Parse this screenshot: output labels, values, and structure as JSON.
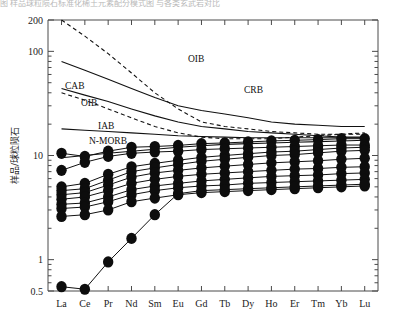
{
  "figure": {
    "top_caption_fragment": "图 样品球粒陨石标准化稀土元素配分模式图 与各类玄武岩对比",
    "y_axis_title": "样品/球粒陨石"
  },
  "chart_data": {
    "type": "line",
    "title": "",
    "subtitle": "",
    "xlabel": "",
    "ylabel": "样品/球粒陨石",
    "yscale": "log",
    "ylim": [
      0.5,
      200
    ],
    "grid": false,
    "legend_position": "inline-annotations",
    "categories": [
      "La",
      "Ce",
      "Pr",
      "Nd",
      "Sm",
      "Eu",
      "Gd",
      "Tb",
      "Dy",
      "Ho",
      "Er",
      "Tm",
      "Yb",
      "Lu"
    ],
    "y_tick_labels": [
      "200",
      "100",
      "10",
      "1",
      "0.5"
    ],
    "y_tick_values": [
      200,
      100,
      10,
      1,
      0.5
    ],
    "marker": "filled-circle",
    "series": [
      {
        "name": "sample-1",
        "style": "solid-marker",
        "values": [
          10.5,
          9.8,
          11.0,
          12.0,
          12.2,
          12.5,
          13.0,
          13.2,
          13.5,
          13.8,
          14.0,
          14.2,
          14.5,
          14.5
        ]
      },
      {
        "name": "sample-2",
        "style": "solid-marker",
        "values": [
          7.2,
          8.6,
          9.8,
          10.5,
          10.8,
          11.0,
          11.4,
          11.6,
          11.8,
          12.0,
          12.2,
          12.4,
          12.6,
          12.6
        ]
      },
      {
        "name": "sample-3",
        "style": "solid-marker",
        "values": [
          5.0,
          5.4,
          6.6,
          7.8,
          8.4,
          9.0,
          9.6,
          10.0,
          10.4,
          10.8,
          11.0,
          11.4,
          11.8,
          12.0
        ]
      },
      {
        "name": "sample-4",
        "style": "solid-marker",
        "values": [
          4.6,
          4.8,
          5.8,
          7.0,
          7.6,
          8.2,
          8.8,
          9.2,
          9.6,
          10.0,
          10.2,
          10.6,
          11.0,
          11.2
        ]
      },
      {
        "name": "sample-5",
        "style": "solid-marker",
        "values": [
          4.2,
          4.4,
          5.2,
          6.2,
          6.8,
          7.2,
          7.6,
          7.9,
          8.2,
          8.5,
          8.7,
          8.9,
          9.2,
          9.4
        ]
      },
      {
        "name": "sample-6",
        "style": "solid-marker",
        "values": [
          3.8,
          4.0,
          4.6,
          5.4,
          5.9,
          6.3,
          6.6,
          6.8,
          7.0,
          7.2,
          7.4,
          7.5,
          7.7,
          7.8
        ]
      },
      {
        "name": "sample-7",
        "style": "solid-marker",
        "values": [
          3.4,
          3.5,
          4.0,
          4.7,
          5.1,
          5.4,
          5.7,
          5.9,
          6.1,
          6.3,
          6.4,
          6.5,
          6.7,
          6.8
        ]
      },
      {
        "name": "sample-8",
        "style": "solid-marker",
        "values": [
          3.1,
          3.2,
          3.6,
          4.2,
          4.6,
          4.9,
          5.1,
          5.2,
          5.4,
          5.5,
          5.6,
          5.7,
          5.8,
          5.9
        ]
      },
      {
        "name": "sample-9",
        "style": "solid-marker",
        "values": [
          2.6,
          2.7,
          3.0,
          3.6,
          3.9,
          4.2,
          4.4,
          4.5,
          4.6,
          4.7,
          4.8,
          4.9,
          5.0,
          5.1
        ],
        "note": "dips at Ho"
      },
      {
        "name": "sample-10",
        "style": "solid-marker",
        "values": [
          0.55,
          0.52,
          0.95,
          1.6,
          2.7,
          4.3,
          4.6,
          4.7,
          4.8,
          4.9,
          5.0,
          5.1,
          5.2,
          5.3
        ]
      }
    ],
    "reference_curves": [
      {
        "name": "OIB-upper",
        "label": "OIB",
        "style": "dashed",
        "label_x_category": "Nd",
        "values_start": 200,
        "values": [
          200,
          140,
          95,
          62,
          40,
          28,
          21,
          19,
          18,
          17,
          16.5,
          16,
          16,
          16
        ]
      },
      {
        "name": "CRB",
        "label": "CRB",
        "style": "solid",
        "values": [
          80,
          66,
          54,
          44,
          36,
          30,
          27,
          25,
          23,
          21,
          20,
          19.5,
          19,
          19
        ]
      },
      {
        "name": "CAB",
        "label": "CAB",
        "style": "solid",
        "values": [
          44,
          38,
          33,
          28,
          24,
          21,
          19,
          18,
          17,
          16.5,
          16,
          15.5,
          15,
          15
        ]
      },
      {
        "name": "OIB-lower",
        "label": "OIB",
        "style": "dashed",
        "values": [
          40,
          34,
          28,
          23,
          19,
          16.5,
          15,
          14.5,
          14.5,
          14.5,
          15,
          15.5,
          16,
          16.5
        ]
      },
      {
        "name": "IAB",
        "label": "IAB",
        "style": "solid",
        "values": [
          18,
          17.5,
          17,
          16.5,
          16,
          15.5,
          15.2,
          15,
          14.8,
          14.8,
          14.8,
          14.8,
          14.8,
          14.8
        ]
      },
      {
        "name": "N-MORB",
        "label": "N-MORB",
        "style": "solid",
        "values": [
          9.5,
          10,
          10.5,
          11,
          11.5,
          12,
          12.4,
          12.8,
          13,
          13.2,
          13.4,
          13.6,
          13.8,
          14
        ]
      }
    ],
    "annotations": [
      {
        "text": "OIB",
        "x": 188,
        "y": 62
      },
      {
        "text": "CAB",
        "x": 65,
        "y": 89
      },
      {
        "text": "CRB",
        "x": 244,
        "y": 93
      },
      {
        "text": "OIB",
        "x": 81,
        "y": 106
      },
      {
        "text": "IAB",
        "x": 98,
        "y": 129
      },
      {
        "text": "N-MORB",
        "x": 89,
        "y": 144
      }
    ]
  }
}
